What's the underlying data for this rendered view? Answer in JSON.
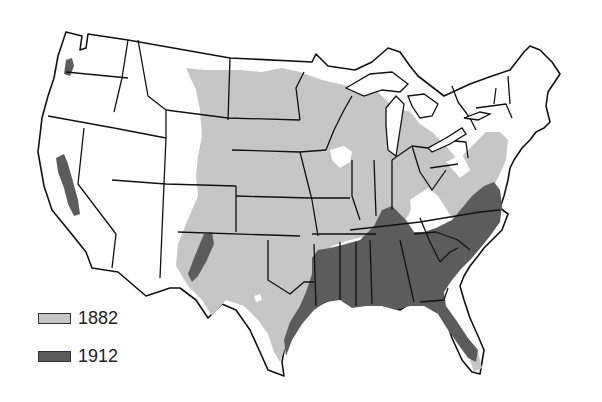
{
  "map": {
    "subject": "United States (contiguous) state outline map",
    "colors": {
      "background": "#ffffff",
      "border": "#111111",
      "area_1882": "#c6c6c6",
      "area_1912": "#5c5c5c"
    }
  },
  "legend": {
    "items": [
      {
        "label": "1882",
        "color": "#c6c6c6"
      },
      {
        "label": "1912",
        "color": "#5c5c5c"
      }
    ]
  }
}
